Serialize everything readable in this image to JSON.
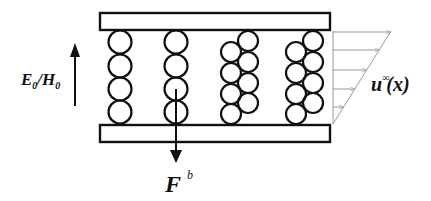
{
  "diagram": {
    "labels": {
      "field": "E",
      "field_sub": "0",
      "field_sep": "/",
      "field2": "H",
      "field2_sub": "0",
      "force": "F",
      "force_sup": "b",
      "flow": "u",
      "flow_sup": "∞",
      "flow_arg": "(x)"
    },
    "colors": {
      "stroke": "#111111",
      "flow_lines": "#9a9a9a",
      "background": "#ffffff"
    },
    "plates": [
      {
        "name": "top-plate",
        "x": 100,
        "y": 13,
        "w": 230,
        "h": 17
      },
      {
        "name": "bottom-plate",
        "x": 100,
        "y": 125,
        "w": 230,
        "h": 17
      }
    ],
    "chains": [
      {
        "name": "single-chain-1",
        "circles": [
          [
            120,
            42
          ],
          [
            120,
            66
          ],
          [
            120,
            89
          ],
          [
            120,
            112
          ]
        ],
        "r": 11.5
      },
      {
        "name": "single-chain-2",
        "circles": [
          [
            176,
            42
          ],
          [
            176,
            66
          ],
          [
            176,
            89
          ],
          [
            176,
            112
          ]
        ],
        "r": 11.5
      },
      {
        "name": "double-chain-3",
        "circles": [
          [
            248,
            41
          ],
          [
            231,
            52
          ],
          [
            248,
            62
          ],
          [
            231,
            73
          ],
          [
            248,
            83
          ],
          [
            231,
            94
          ],
          [
            248,
            103
          ],
          [
            231,
            114
          ]
        ],
        "r": 10
      },
      {
        "name": "double-chain-4",
        "circles": [
          [
            313,
            41
          ],
          [
            296,
            52
          ],
          [
            313,
            62
          ],
          [
            296,
            73
          ],
          [
            313,
            83
          ],
          [
            296,
            94
          ],
          [
            313,
            103
          ],
          [
            296,
            114
          ]
        ],
        "r": 10
      }
    ],
    "flow_profile": {
      "base_x": 333,
      "top_y": 31,
      "bottom_y": 124,
      "tip_x": 391,
      "arrows_y": [
        32,
        50,
        70,
        89,
        107
      ]
    },
    "field_arrow": {
      "x": 75,
      "y_start": 106,
      "y_end": 45
    },
    "force_arrow": {
      "x": 176,
      "y_start": 89,
      "y_end": 163
    }
  }
}
